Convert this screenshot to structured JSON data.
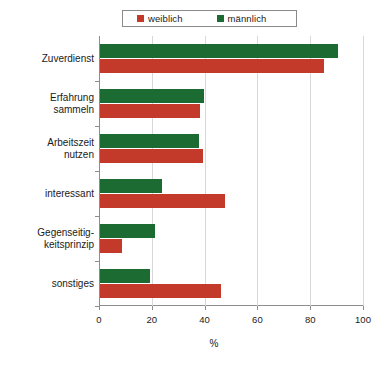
{
  "chart_data": {
    "type": "bar",
    "orientation": "horizontal",
    "title": "",
    "xlabel": "%",
    "ylabel": "",
    "xlim": [
      0,
      100
    ],
    "xticks": [
      0,
      20,
      40,
      60,
      80,
      100
    ],
    "xtick_labels": [
      "0",
      "20",
      "40",
      "60",
      "80",
      "100"
    ],
    "grid": true,
    "legend_position": "top-center",
    "categories": [
      "Zuverdienst",
      "Erfahrung\nsammeln",
      "Arbeitszeit\nnutzen",
      "interessant",
      "Gegenseitig-\nkeitsprinzip",
      "sonstiges"
    ],
    "series": [
      {
        "name": "weiblich",
        "color": "#c3392a",
        "values": [
          85,
          38,
          39,
          47.5,
          8.5,
          46
        ]
      },
      {
        "name": "männlich",
        "color": "#1c6b33",
        "values": [
          90,
          39.5,
          37.5,
          23.5,
          21,
          19
        ]
      }
    ]
  },
  "legend": {
    "entries": [
      {
        "label": "weiblich",
        "color": "#c3392a"
      },
      {
        "label": "männlich",
        "color": "#1c6b33"
      }
    ]
  },
  "axis": {
    "x_title": "%"
  }
}
